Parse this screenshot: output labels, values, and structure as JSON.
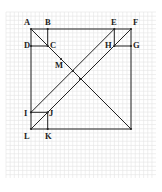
{
  "figure": {
    "type": "geometry-diagram",
    "grid": {
      "x0": 6,
      "y0": 12,
      "x1": 156,
      "y1": 178,
      "step": 4.17,
      "color": "#e4e4e4"
    },
    "line_color": "#222222",
    "points": [
      {
        "name": "A",
        "x": 31,
        "y": 29,
        "lx": 24,
        "ly": 25
      },
      {
        "name": "B",
        "x": 47.7,
        "y": 29,
        "lx": 45,
        "ly": 25
      },
      {
        "name": "C",
        "x": 47.7,
        "y": 46,
        "lx": 50,
        "ly": 48
      },
      {
        "name": "D",
        "x": 31,
        "y": 46,
        "lx": 24,
        "ly": 48
      },
      {
        "name": "E",
        "x": 114.3,
        "y": 29,
        "lx": 111,
        "ly": 25
      },
      {
        "name": "F",
        "x": 131,
        "y": 29,
        "lx": 133,
        "ly": 25
      },
      {
        "name": "G",
        "x": 131,
        "y": 46,
        "lx": 133,
        "ly": 48
      },
      {
        "name": "H",
        "x": 114.3,
        "y": 46,
        "lx": 105,
        "ly": 48
      },
      {
        "name": "M",
        "x": 61,
        "y": 59,
        "lx": 55,
        "ly": 68
      },
      {
        "name": "I",
        "x": 31,
        "y": 112.3,
        "lx": 24,
        "ly": 116
      },
      {
        "name": "J",
        "x": 47.7,
        "y": 112.3,
        "lx": 49,
        "ly": 116
      },
      {
        "name": "K",
        "x": 47.7,
        "y": 129,
        "lx": 45,
        "ly": 139
      },
      {
        "name": "L",
        "x": 31,
        "y": 129,
        "lx": 24,
        "ly": 139
      },
      {
        "name": "",
        "x": 131,
        "y": 129,
        "lx": 0,
        "ly": 0
      }
    ],
    "segments": [
      [
        "A",
        "F"
      ],
      [
        "F",
        "BR"
      ],
      [
        "BR",
        "L"
      ],
      [
        "L",
        "A"
      ],
      [
        "B",
        "C"
      ],
      [
        "C",
        "D"
      ],
      [
        "E",
        "H"
      ],
      [
        "H",
        "G"
      ],
      [
        "I",
        "J"
      ],
      [
        "J",
        "K"
      ],
      [
        "A",
        "BR"
      ],
      [
        "I",
        "E"
      ],
      [
        "L",
        "F"
      ]
    ],
    "intersections": [
      {
        "x": 73,
        "y": 71
      },
      {
        "x": 80,
        "y": 79
      }
    ]
  }
}
